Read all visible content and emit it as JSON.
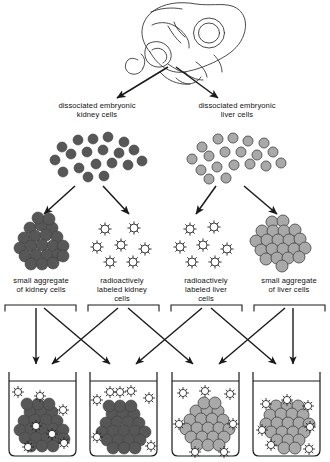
{
  "figure": {
    "source_label": "embryo",
    "colors": {
      "kidney_cell": "#575757",
      "kidney_cell_edge": "#3a3a3a",
      "liver_cell": "#a9a9a9",
      "liver_cell_edge": "#555555",
      "labeled_cell_fill": "#ffffff",
      "labeled_cell_edge": "#1a1a1a",
      "line": "#1a1a1a",
      "background": "#ffffff"
    }
  },
  "top": {
    "embryo_icon": "embryo-line-drawing",
    "arrow_left": "arrow-down-left",
    "arrow_right": "arrow-down-right"
  },
  "dissociated": {
    "left": {
      "label": "dissociated embryonic\nkidney cells",
      "cell_type": "kidney",
      "count": 19
    },
    "right": {
      "label": "dissociated embryonic\nliver cells",
      "cell_type": "liver",
      "count": 19
    }
  },
  "preparations": [
    {
      "id": "small-aggregate-kidney",
      "label": "small aggregate\nof kidney cells",
      "kind": "aggregate",
      "cell_type": "kidney",
      "cell_count": 22
    },
    {
      "id": "labeled-kidney",
      "label": "radioactively\nlabeled kidney\ncells",
      "kind": "labeled-single-cells",
      "cell_type": "kidney",
      "cell_count": 7
    },
    {
      "id": "labeled-liver",
      "label": "radioactively\nlabeled liver\ncells",
      "kind": "labeled-single-cells",
      "cell_type": "liver",
      "cell_count": 7
    },
    {
      "id": "small-aggregate-liver",
      "label": "small aggregate\nof liver cells",
      "kind": "aggregate",
      "cell_type": "liver",
      "cell_count": 21
    }
  ],
  "beakers": [
    {
      "id": "beaker-1",
      "aggregate_type": "kidney",
      "labeled_type": "kidney",
      "labeled_incorporated": true,
      "aggregate_cells": 23,
      "labeled_inside": 4,
      "labeled_outside": 3
    },
    {
      "id": "beaker-2",
      "aggregate_type": "kidney",
      "labeled_type": "liver",
      "labeled_incorporated": false,
      "aggregate_cells": 22,
      "labeled_inside": 0,
      "labeled_outside": 7
    },
    {
      "id": "beaker-3",
      "aggregate_type": "liver",
      "labeled_type": "kidney",
      "labeled_incorporated": false,
      "aggregate_cells": 21,
      "labeled_inside": 0,
      "labeled_outside": 7
    },
    {
      "id": "beaker-4",
      "aggregate_type": "liver",
      "labeled_type": "liver",
      "labeled_incorporated": true,
      "aggregate_cells": 21,
      "labeled_inside": 5,
      "labeled_outside": 2
    }
  ]
}
